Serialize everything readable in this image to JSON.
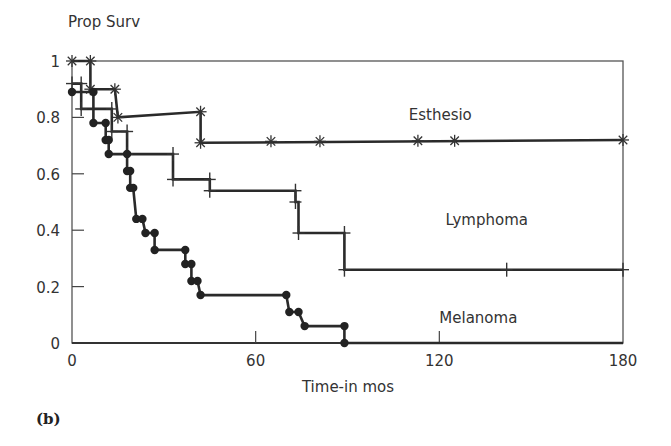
{
  "figure": {
    "panel_label": "(b)"
  },
  "chart_data": {
    "type": "line",
    "subtype": "kaplan-meier step",
    "title": "",
    "ylabel": "Prop Surv",
    "xlabel": "Time-in mos",
    "xlim": [
      0,
      180
    ],
    "ylim": [
      0,
      1
    ],
    "xticks": [
      0,
      60,
      120,
      180
    ],
    "yticks": [
      0,
      0.2,
      0.4,
      0.6,
      0.8,
      1
    ],
    "ytick_labels": [
      "0",
      "0.2",
      "0.4",
      "0.6",
      "0.8",
      "1"
    ],
    "grid": false,
    "legend": "inline labels",
    "series": [
      {
        "name": "Esthesio",
        "marker": "star",
        "label_pos": [
          110,
          0.79
        ],
        "path": [
          [
            0,
            1.0
          ],
          [
            6,
            1.0
          ],
          [
            6,
            0.9
          ],
          [
            14,
            0.9
          ],
          [
            15,
            0.8
          ],
          [
            42,
            0.82
          ],
          [
            42,
            0.71
          ],
          [
            180,
            0.72
          ]
        ],
        "markers": [
          [
            0,
            1.0
          ],
          [
            6,
            1.0
          ],
          [
            6,
            0.9
          ],
          [
            14,
            0.9
          ],
          [
            15,
            0.8
          ],
          [
            42,
            0.82
          ],
          [
            42,
            0.71
          ],
          [
            65,
            0.715
          ],
          [
            81,
            0.715
          ],
          [
            113,
            0.717
          ],
          [
            125,
            0.717
          ],
          [
            180,
            0.72
          ]
        ]
      },
      {
        "name": "Lymphoma",
        "marker": "tick",
        "label_pos": [
          122,
          0.42
        ],
        "path": [
          [
            0,
            0.92
          ],
          [
            3,
            0.92
          ],
          [
            3,
            0.83
          ],
          [
            13,
            0.83
          ],
          [
            13,
            0.75
          ],
          [
            18,
            0.75
          ],
          [
            18,
            0.67
          ],
          [
            33,
            0.67
          ],
          [
            33,
            0.58
          ],
          [
            45,
            0.58
          ],
          [
            45,
            0.54
          ],
          [
            73,
            0.54
          ],
          [
            73,
            0.5
          ],
          [
            74,
            0.5
          ],
          [
            74,
            0.39
          ],
          [
            89,
            0.39
          ],
          [
            89,
            0.26
          ],
          [
            180,
            0.26
          ]
        ],
        "markers": [
          [
            0,
            0.92
          ],
          [
            3,
            0.92
          ],
          [
            3,
            0.83
          ],
          [
            13,
            0.83
          ],
          [
            13,
            0.75
          ],
          [
            18,
            0.75
          ],
          [
            18,
            0.67
          ],
          [
            33,
            0.67
          ],
          [
            33,
            0.58
          ],
          [
            45,
            0.58
          ],
          [
            45,
            0.54
          ],
          [
            73,
            0.54
          ],
          [
            73,
            0.5
          ],
          [
            74,
            0.39
          ],
          [
            89,
            0.39
          ],
          [
            89,
            0.26
          ],
          [
            142,
            0.26
          ],
          [
            180,
            0.26
          ]
        ]
      },
      {
        "name": "Melanoma",
        "marker": "dot",
        "label_pos": [
          120,
          0.07
        ],
        "path": [
          [
            0,
            0.89
          ],
          [
            7,
            0.89
          ],
          [
            7,
            0.78
          ],
          [
            11,
            0.78
          ],
          [
            11,
            0.72
          ],
          [
            12,
            0.72
          ],
          [
            12,
            0.67
          ],
          [
            18,
            0.67
          ],
          [
            18,
            0.61
          ],
          [
            19,
            0.61
          ],
          [
            19,
            0.55
          ],
          [
            20,
            0.55
          ],
          [
            21,
            0.44
          ],
          [
            23,
            0.44
          ],
          [
            24,
            0.39
          ],
          [
            27,
            0.39
          ],
          [
            27,
            0.33
          ],
          [
            37,
            0.33
          ],
          [
            37,
            0.28
          ],
          [
            39,
            0.28
          ],
          [
            39,
            0.22
          ],
          [
            41,
            0.22
          ],
          [
            42,
            0.17
          ],
          [
            70,
            0.17
          ],
          [
            71,
            0.11
          ],
          [
            74,
            0.11
          ],
          [
            76,
            0.06
          ],
          [
            89,
            0.06
          ],
          [
            89,
            0.0
          ],
          [
            180,
            0.0
          ]
        ],
        "markers": [
          [
            0,
            0.89
          ],
          [
            7,
            0.89
          ],
          [
            7,
            0.78
          ],
          [
            11,
            0.78
          ],
          [
            11,
            0.72
          ],
          [
            12,
            0.72
          ],
          [
            12,
            0.67
          ],
          [
            18,
            0.67
          ],
          [
            18,
            0.61
          ],
          [
            19,
            0.61
          ],
          [
            19,
            0.55
          ],
          [
            20,
            0.55
          ],
          [
            21,
            0.44
          ],
          [
            23,
            0.44
          ],
          [
            24,
            0.39
          ],
          [
            27,
            0.39
          ],
          [
            27,
            0.33
          ],
          [
            37,
            0.33
          ],
          [
            37,
            0.28
          ],
          [
            39,
            0.28
          ],
          [
            39,
            0.22
          ],
          [
            41,
            0.22
          ],
          [
            42,
            0.17
          ],
          [
            70,
            0.17
          ],
          [
            71,
            0.11
          ],
          [
            74,
            0.11
          ],
          [
            76,
            0.06
          ],
          [
            89,
            0.06
          ],
          [
            89,
            0.0
          ]
        ]
      }
    ]
  }
}
